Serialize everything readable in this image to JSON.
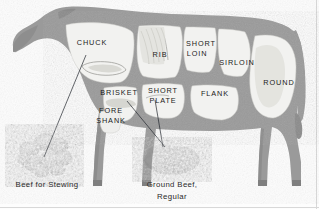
{
  "diagram": {
    "colors": {
      "body": "#9a9a9a",
      "body_shadow": "#8b8b8b",
      "cut_fill": "#f2f2f0",
      "cut_fill_shade": "#e3e3df",
      "outline": "#7e7e7e",
      "label_text": "#1b1b1b",
      "product_text": "#2a2a2a",
      "leader_line": "#22272e",
      "background": "#fdfdfd",
      "meat_dark": "#6f6f6f",
      "meat_mid": "#8d8d8d",
      "meat_light": "#a8a8a8"
    },
    "cuts": [
      {
        "id": "chuck",
        "label": "CHUCK",
        "x": 92,
        "y": 45
      },
      {
        "id": "rib",
        "label": "RIB",
        "x": 160,
        "y": 57
      },
      {
        "id": "short-loin",
        "label": "SHORT",
        "x": 201,
        "y": 46,
        "label2": "LOIN",
        "x2": 197,
        "y2": 56
      },
      {
        "id": "sirloin",
        "label": "SIRLOIN",
        "x": 237,
        "y": 65
      },
      {
        "id": "round",
        "label": "ROUND",
        "x": 279,
        "y": 85
      },
      {
        "id": "brisket",
        "label": "BRISKET",
        "x": 119,
        "y": 95
      },
      {
        "id": "fore-shank",
        "label": "FORE",
        "x": 111,
        "y": 113,
        "label2": "SHANK",
        "x2": 111,
        "y2": 123
      },
      {
        "id": "short-plate",
        "label": "SHORT",
        "x": 163,
        "y": 93,
        "label2": "PLATE",
        "x2": 163,
        "y2": 103
      },
      {
        "id": "flank",
        "label": "FLANK",
        "x": 215,
        "y": 96
      }
    ],
    "products": [
      {
        "id": "beef-for-stewing",
        "line1": "Beef for Stewing",
        "line2": "",
        "cx": 47,
        "cy": 184
      },
      {
        "id": "ground-beef",
        "line1": "Ground Beef,",
        "line2": "Regular",
        "cx": 172,
        "cy": 184
      }
    ],
    "leaders": [
      {
        "id": "chuck-to-stew",
        "from": "chuck",
        "to": "beef-for-stewing"
      },
      {
        "id": "brisket-to-ground",
        "from": "brisket",
        "to": "ground-beef"
      },
      {
        "id": "shortplate-to-ground",
        "from": "short-plate",
        "to": "ground-beef"
      }
    ]
  }
}
